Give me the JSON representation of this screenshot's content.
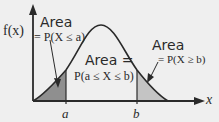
{
  "diagram": {
    "type": "probability-density-curve",
    "y_axis_label": "f(x)",
    "x_axis_label": "x",
    "tick_labels": {
      "a": "a",
      "b": "b"
    },
    "annotations": {
      "left_area_title": "Area",
      "left_area_formula": "= P(X ≤ a)",
      "middle_area_title": "Area =",
      "middle_area_formula": "P(a ≤ X ≤ b)",
      "right_area_title": "Area",
      "right_area_formula": "= P(X ≥ b)"
    },
    "colors": {
      "background": "#efefef",
      "curve": "#2a2a2a",
      "left_tail_fill": "#8f8f8f",
      "right_tail_fill": "#c4c4c4",
      "axis": "#2a2a2a"
    }
  }
}
